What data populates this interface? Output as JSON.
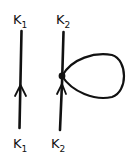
{
  "diagram": {
    "type": "feynman-diagram",
    "left_line": {
      "top_label": "K",
      "top_sub": "1",
      "bottom_label": "K",
      "bottom_sub": "1",
      "arrow": "up"
    },
    "right_line": {
      "top_label": "K",
      "top_sub": "2",
      "bottom_label": "K",
      "bottom_sub": "2",
      "arrow": "up",
      "vertex": "dot",
      "loop": "tadpole"
    },
    "stroke_color": "#111111",
    "background": "#ffffff"
  }
}
